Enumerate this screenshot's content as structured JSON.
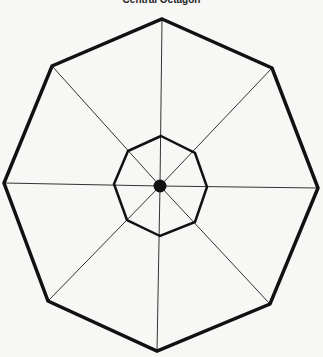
{
  "title": "Central Octagon",
  "diagram": {
    "background": "#f7f7f5",
    "stroke_color": "#111111",
    "outer_octagon": {
      "points": [
        [
          162,
          19
        ],
        [
          272,
          68
        ],
        [
          318,
          188
        ],
        [
          270,
          304
        ],
        [
          157,
          351
        ],
        [
          48,
          301
        ],
        [
          4,
          183
        ],
        [
          52,
          66
        ]
      ],
      "stroke_width": 3.5
    },
    "inner_octagon": {
      "points": [
        [
          161,
          136
        ],
        [
          195,
          153
        ],
        [
          207,
          187
        ],
        [
          195,
          222
        ],
        [
          160,
          236
        ],
        [
          127,
          220
        ],
        [
          114,
          184
        ],
        [
          128,
          151
        ]
      ],
      "stroke_width": 2.5
    },
    "center": {
      "cx": 160,
      "cy": 186,
      "r": 6.5
    },
    "spokes": 8,
    "spoke_width": 1
  }
}
